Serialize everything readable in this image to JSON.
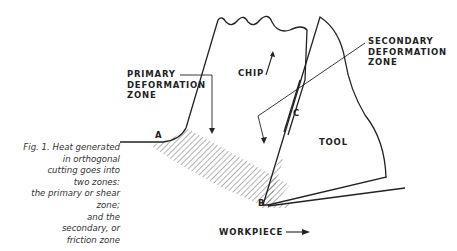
{
  "figure": {
    "caption_lines": [
      "Fig. 1. Heat generated",
      "in orthogonal",
      "cutting goes into",
      "two zones:",
      "the primary or shear",
      "zone;",
      "and the",
      "secondary, or",
      "friction zone"
    ],
    "labels": {
      "primary_zone": [
        "PRIMARY",
        "DEFORMATION",
        "ZONE"
      ],
      "secondary_zone": [
        "SECONDARY",
        "DEFORMATION",
        "ZONE"
      ],
      "chip": "CHIP",
      "tool": "TOOL",
      "workpiece": "WORKPIECE",
      "point_a": "A",
      "point_b": "B",
      "point_c": "C"
    },
    "colors": {
      "line": "#222222",
      "hatch": "#555555"
    }
  }
}
